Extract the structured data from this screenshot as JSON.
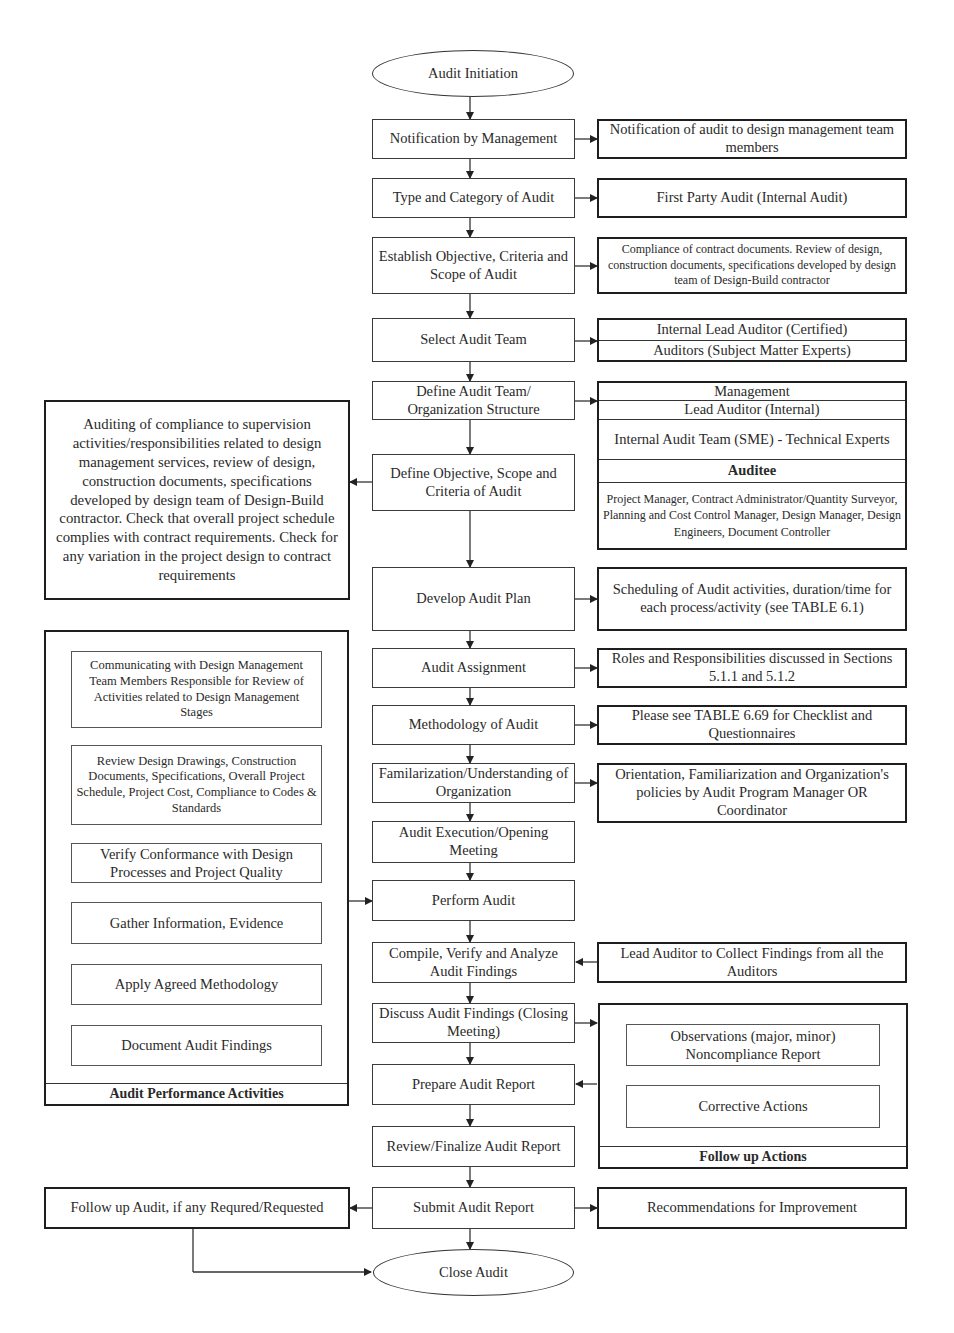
{
  "flow": {
    "start": "Audit Initiation",
    "end": "Close Audit",
    "steps": [
      {
        "id": "notification",
        "label": "Notification by Management"
      },
      {
        "id": "type",
        "label": "Type and Category of Audit"
      },
      {
        "id": "establish",
        "label": "Establish Objective, Criteria and Scope of Audit"
      },
      {
        "id": "select_team",
        "label": "Select Audit Team"
      },
      {
        "id": "define_team",
        "label": "Define Audit Team/ Organization Structure"
      },
      {
        "id": "define_objective",
        "label": "Define Objective, Scope and Criteria of Audit"
      },
      {
        "id": "plan",
        "label": "Develop Audit Plan"
      },
      {
        "id": "assignment",
        "label": "Audit Assignment"
      },
      {
        "id": "methodology",
        "label": "Methodology of Audit"
      },
      {
        "id": "familiarization",
        "label": "Familarization/Understanding of Organization"
      },
      {
        "id": "execution",
        "label": "Audit Execution/Opening Meeting"
      },
      {
        "id": "perform",
        "label": "Perform Audit"
      },
      {
        "id": "compile",
        "label": "Compile, Verify and Analyze Audit Findings"
      },
      {
        "id": "discuss",
        "label": "Discuss Audit Findings (Closing Meeting)"
      },
      {
        "id": "prepare",
        "label": "Prepare Audit Report"
      },
      {
        "id": "review",
        "label": "Review/Finalize Audit Report"
      },
      {
        "id": "submit",
        "label": "Submit Audit Report"
      }
    ]
  },
  "side_notes": {
    "notification": "Notification of audit to design management team members",
    "type": "First Party Audit (Internal Audit)",
    "establish": "Compliance of contract documents. Review of design, construction documents, specifications developed by design team of Design-Build contractor",
    "select_team": [
      "Internal Lead Auditor (Certified)",
      "Auditors (Subject Matter Experts)"
    ],
    "org_structure": {
      "rows": [
        "Management",
        "Lead Auditor (Internal)",
        "Internal Audit Team  (SME) - Technical Experts"
      ],
      "auditee_heading": "Auditee",
      "auditee_members": "Project Manager, Contract Administrator/Quantity Surveyor, Planning and Cost Control Manager, Design Manager, Design Engineers, Document Controller"
    },
    "objective_detail": "Auditing of compliance to supervision activities/responsibilities related to design management services, review of design, construction documents, specifications developed by design team of Design-Build contractor. Check that overall project schedule complies with contract requirements. Check for any variation in the project design to contract requirements",
    "plan": "Scheduling of Audit activities, duration/time for each process/activity (see TABLE 6.1)",
    "assignment": "Roles and Responsibilities discussed in Sections 5.1.1 and 5.1.2",
    "methodology": "Please see TABLE 6.69 for Checklist and Questionnaires",
    "familiarization": "Orientation, Familiarization and Organization's policies by Audit Program Manager OR Coordinator",
    "compile": "Lead Auditor to Collect Findings from all the Auditors",
    "submit_right": "Recommendations for Improvement",
    "submit_left": "Follow up Audit, if any Requred/Requested"
  },
  "performance_panel": {
    "title": "Audit Performance Activities",
    "items": [
      "Communicating with Design Management Team Members Responsible for Review of Activities related to  Design Management Stages",
      "Review Design Drawings, Construction Documents, Specifications, Overall Project Schedule, Project Cost, Compliance to Codes & Standards",
      "Verify Conformance with Design Processes and Project Quality",
      "Gather Information, Evidence",
      "Apply Agreed Methodology",
      "Document Audit Findings"
    ]
  },
  "followup_panel": {
    "title": "Follow up Actions",
    "items": [
      "Observations (major, minor) Noncompliance Report",
      "Corrective Actions"
    ]
  }
}
